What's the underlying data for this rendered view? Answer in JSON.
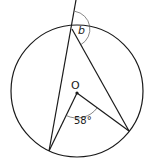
{
  "diagram": {
    "type": "circle-theorem",
    "center_label": "O",
    "angle_at_center": "58°",
    "unknown_angle": "b",
    "colors": {
      "line": "#1a1a1a",
      "arc": "#555555",
      "background": "#ffffff"
    },
    "circle": {
      "cx": 77,
      "cy": 91,
      "r": 66
    },
    "points": {
      "top": [
        72,
        29
      ],
      "bottom_left": [
        49,
        151
      ],
      "right": [
        129,
        131
      ],
      "center": [
        77,
        93
      ],
      "extension_end": [
        76,
        0
      ]
    }
  }
}
